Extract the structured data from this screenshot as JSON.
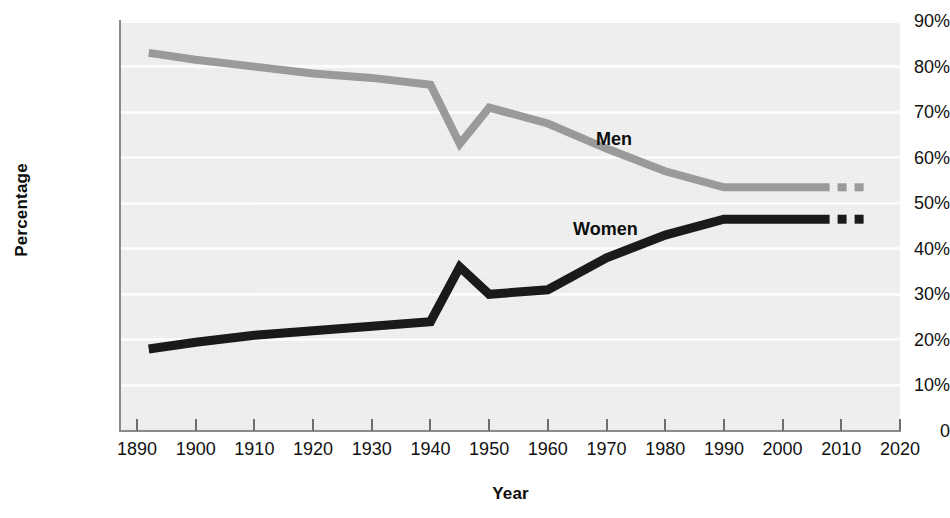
{
  "chart_data": {
    "type": "line",
    "title": "",
    "xlabel": "Year",
    "ylabel": "Percentage",
    "xlim": [
      1890,
      2020
    ],
    "ylim": [
      0,
      90
    ],
    "grid": true,
    "legend_position": "inline-labels",
    "x_ticks": [
      "1890",
      "1900",
      "1910",
      "1920",
      "1930",
      "1940",
      "1950",
      "1960",
      "1970",
      "1980",
      "1990",
      "2000",
      "2010",
      "2020"
    ],
    "y_ticks": [
      "90%",
      "80%",
      "70%",
      "60%",
      "50%",
      "40%",
      "30%",
      "20%",
      "10%",
      "0"
    ],
    "series": [
      {
        "name": "Men",
        "color": "#9a9a9a",
        "label_text": "Men",
        "x": [
          1892,
          1900,
          1910,
          1920,
          1930,
          1940,
          1945,
          1950,
          1960,
          1970,
          1980,
          1990,
          2000,
          2010,
          2014
        ],
        "values": [
          83,
          81.5,
          80,
          78.5,
          77.5,
          76,
          63,
          71,
          67.5,
          62,
          57,
          53.5,
          53.5,
          53.5,
          53.5
        ],
        "dashed_from": 2008
      },
      {
        "name": "Women",
        "color": "#1a1a1a",
        "label_text": "Women",
        "x": [
          1892,
          1900,
          1910,
          1920,
          1930,
          1940,
          1945,
          1950,
          1960,
          1970,
          1980,
          1990,
          2000,
          2010,
          2014
        ],
        "values": [
          18,
          19.5,
          21,
          22,
          23,
          24,
          36,
          30,
          31,
          38,
          43,
          46.5,
          46.5,
          46.5,
          46.5
        ],
        "dashed_from": 2008
      }
    ]
  },
  "axis": {
    "y_title": "Percentage",
    "x_title": "Year"
  }
}
